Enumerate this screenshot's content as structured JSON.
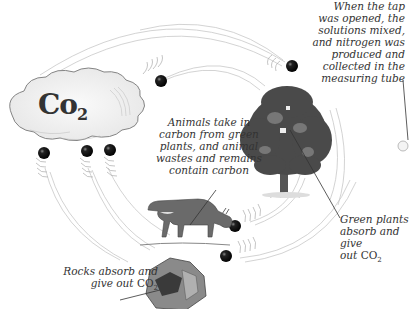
{
  "diagram": {
    "cloud_label": "Co",
    "cloud_label_subscript": "2",
    "labels": {
      "tap": "When the tap was opened, the solutions mixed, and nitrogen was produced and collected in the measuring tube",
      "tap_lines": [
        "When the tap",
        "was opened, the",
        "solutions mixed,",
        "and nitrogen was",
        "produced and",
        "collected in the",
        "measuring tube"
      ],
      "animals_lines": [
        "Animals take in",
        "carbon from green",
        "plants, and animal",
        "wastes and remains",
        "contain carbon"
      ],
      "plants_lines": [
        "Green plants",
        "absorb and give",
        "out"
      ],
      "plants_chem": "CO",
      "plants_chem_sub": "2",
      "rocks_lines": [
        "Rocks absorb and",
        "give out"
      ],
      "rocks_chem": "CO",
      "rocks_chem_sub": "2"
    },
    "nodes": [
      {
        "name": "CO2 cloud",
        "role": "atmosphere"
      },
      {
        "name": "Tree",
        "role": "green plants"
      },
      {
        "name": "Cow",
        "role": "animals"
      },
      {
        "name": "Rocks",
        "role": "rocks"
      }
    ],
    "colors": {
      "background": "#ffffff",
      "ink": "#333333",
      "ball": "#111111",
      "arrow_stroke": "#bbbbbb",
      "foliage": "#4a4a4a"
    }
  }
}
